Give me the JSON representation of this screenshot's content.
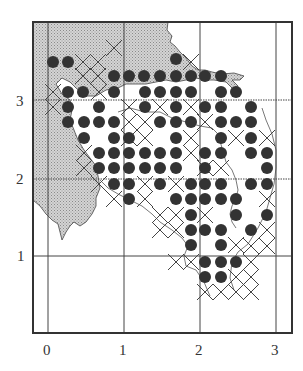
{
  "figure": {
    "type": "grid map with symbol overlay",
    "x_axis": {
      "ticks": [
        "0",
        "1",
        "2",
        "3"
      ]
    },
    "y_axis": {
      "ticks": [
        "1",
        "2",
        "3"
      ]
    },
    "colors": {
      "land": "#c8c8c8",
      "dot": "#333333",
      "line": "#444444",
      "frame": "#333333"
    },
    "legend": "none visible",
    "symbols": {
      "filled_circle": "occupied cell (dot)",
      "cross": "X mark cell"
    },
    "dots": [
      [
        53,
        62
      ],
      [
        68,
        62
      ],
      [
        176,
        59
      ],
      [
        114,
        76
      ],
      [
        129,
        76
      ],
      [
        144,
        76
      ],
      [
        160,
        76
      ],
      [
        176,
        76
      ],
      [
        191,
        76
      ],
      [
        205,
        76
      ],
      [
        221,
        76
      ],
      [
        68,
        92
      ],
      [
        83,
        92
      ],
      [
        114,
        92
      ],
      [
        145,
        92
      ],
      [
        160,
        92
      ],
      [
        176,
        92
      ],
      [
        191,
        92
      ],
      [
        221,
        92
      ],
      [
        236,
        92
      ],
      [
        68,
        107
      ],
      [
        99,
        107
      ],
      [
        145,
        107
      ],
      [
        176,
        107
      ],
      [
        205,
        107
      ],
      [
        221,
        107
      ],
      [
        251,
        107
      ],
      [
        68,
        122
      ],
      [
        84,
        122
      ],
      [
        99,
        122
      ],
      [
        114,
        122
      ],
      [
        160,
        122
      ],
      [
        176,
        122
      ],
      [
        191,
        122
      ],
      [
        221,
        122
      ],
      [
        236,
        122
      ],
      [
        251,
        122
      ],
      [
        84,
        138
      ],
      [
        114,
        138
      ],
      [
        129,
        138
      ],
      [
        176,
        138
      ],
      [
        221,
        138
      ],
      [
        251,
        138
      ],
      [
        99,
        153
      ],
      [
        114,
        153
      ],
      [
        129,
        153
      ],
      [
        145,
        153
      ],
      [
        160,
        153
      ],
      [
        176,
        153
      ],
      [
        205,
        153
      ],
      [
        221,
        153
      ],
      [
        251,
        153
      ],
      [
        267,
        153
      ],
      [
        99,
        168
      ],
      [
        114,
        168
      ],
      [
        129,
        168
      ],
      [
        145,
        168
      ],
      [
        160,
        168
      ],
      [
        176,
        168
      ],
      [
        205,
        168
      ],
      [
        267,
        168
      ],
      [
        114,
        184
      ],
      [
        129,
        184
      ],
      [
        160,
        184
      ],
      [
        191,
        184
      ],
      [
        205,
        184
      ],
      [
        221,
        184
      ],
      [
        251,
        184
      ],
      [
        267,
        184
      ],
      [
        129,
        199
      ],
      [
        176,
        199
      ],
      [
        191,
        199
      ],
      [
        205,
        199
      ],
      [
        221,
        199
      ],
      [
        236,
        199
      ],
      [
        191,
        215
      ],
      [
        236,
        215
      ],
      [
        267,
        215
      ],
      [
        191,
        230
      ],
      [
        205,
        230
      ],
      [
        221,
        230
      ],
      [
        251,
        230
      ],
      [
        191,
        245
      ],
      [
        221,
        245
      ],
      [
        205,
        262
      ],
      [
        221,
        262
      ],
      [
        236,
        262
      ],
      [
        205,
        277
      ],
      [
        221,
        277
      ]
    ],
    "crosses": [
      [
        83,
        62
      ],
      [
        98,
        62
      ],
      [
        114,
        48
      ],
      [
        191,
        62
      ],
      [
        83,
        76
      ],
      [
        53,
        92
      ],
      [
        99,
        92
      ],
      [
        98,
        76
      ],
      [
        53,
        107
      ],
      [
        129,
        107
      ],
      [
        145,
        122
      ],
      [
        160,
        107
      ],
      [
        129,
        122
      ],
      [
        191,
        107
      ],
      [
        205,
        122
      ],
      [
        236,
        138
      ],
      [
        191,
        138
      ],
      [
        145,
        138
      ],
      [
        129,
        138
      ],
      [
        84,
        153
      ],
      [
        84,
        168
      ],
      [
        191,
        153
      ],
      [
        205,
        168
      ],
      [
        221,
        168
      ],
      [
        99,
        184
      ],
      [
        145,
        184
      ],
      [
        176,
        184
      ],
      [
        267,
        199
      ],
      [
        267,
        230
      ],
      [
        251,
        246
      ],
      [
        267,
        246
      ],
      [
        145,
        199
      ],
      [
        160,
        215
      ],
      [
        176,
        215
      ],
      [
        205,
        215
      ],
      [
        191,
        262
      ],
      [
        176,
        262
      ],
      [
        205,
        292
      ],
      [
        221,
        292
      ],
      [
        236,
        292
      ],
      [
        251,
        292
      ],
      [
        236,
        277
      ],
      [
        251,
        277
      ],
      [
        267,
        138
      ],
      [
        114,
        199
      ],
      [
        160,
        230
      ],
      [
        176,
        230
      ],
      [
        236,
        245
      ],
      [
        251,
        262
      ]
    ]
  }
}
